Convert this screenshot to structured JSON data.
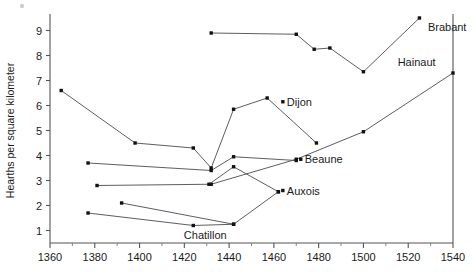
{
  "chart_data": {
    "type": "line",
    "title": "",
    "subtitle": "",
    "xlabel": "",
    "ylabel": "Hearths per square kilometer",
    "xlim": [
      1360,
      1540
    ],
    "ylim": [
      0.5,
      9.5
    ],
    "x_ticks": [
      1360,
      1380,
      1400,
      1420,
      1440,
      1460,
      1480,
      1500,
      1520,
      1540
    ],
    "x_tick_labels": [
      "1360",
      "1380",
      "1400",
      "1420",
      "1440",
      "1460",
      "1480",
      "1500",
      "1520",
      "1540"
    ],
    "x_minor_ticks": [
      1370,
      1390,
      1410,
      1430,
      1450,
      1470,
      1490,
      1510,
      1530
    ],
    "y_ticks": [
      1,
      2,
      3,
      4,
      5,
      6,
      7,
      8,
      9
    ],
    "y_tick_labels": [
      "1",
      "2",
      "3",
      "4",
      "5",
      "6",
      "7",
      "8",
      "9"
    ],
    "grid": false,
    "legend": "inline-end-labels",
    "marker": "square",
    "series": [
      {
        "name": "Brabant",
        "label": "Brabant",
        "label_x": 1527,
        "label_y": 9.15,
        "label_anchor": "start",
        "points": [
          {
            "x": 1432,
            "y": 8.9
          },
          {
            "x": 1470,
            "y": 8.85
          },
          {
            "x": 1478,
            "y": 8.25
          },
          {
            "x": 1485,
            "y": 8.3
          },
          {
            "x": 1500,
            "y": 7.35
          },
          {
            "x": 1525,
            "y": 9.5
          }
        ]
      },
      {
        "name": "Hainaut",
        "label": "Hainaut",
        "label_x": 1534,
        "label_y": 7.75,
        "label_anchor": "end",
        "points": [
          {
            "x": 1432,
            "y": 2.85
          },
          {
            "x": 1470,
            "y": 3.85
          },
          {
            "x": 1500,
            "y": 4.95
          },
          {
            "x": 1540,
            "y": 7.3
          }
        ]
      },
      {
        "name": "Dijon",
        "label": "Dijon",
        "label_x": 1464,
        "label_y": 6.15,
        "label_anchor": "start",
        "points": [
          {
            "x": 1365,
            "y": 6.6
          },
          {
            "x": 1398,
            "y": 4.5
          },
          {
            "x": 1424,
            "y": 4.3
          },
          {
            "x": 1432,
            "y": 3.5
          },
          {
            "x": 1442,
            "y": 5.85
          },
          {
            "x": 1457,
            "y": 6.3
          },
          {
            "x": 1479,
            "y": 4.5
          }
        ]
      },
      {
        "name": "Beaune",
        "label": "Beaune",
        "label_x": 1472,
        "label_y": 3.85,
        "label_anchor": "start",
        "points": [
          {
            "x": 1377,
            "y": 3.7
          },
          {
            "x": 1432,
            "y": 3.4
          },
          {
            "x": 1442,
            "y": 3.95
          },
          {
            "x": 1470,
            "y": 3.8
          }
        ]
      },
      {
        "name": "Auxois",
        "label": "Auxois",
        "label_x": 1464,
        "label_y": 2.6,
        "label_anchor": "start",
        "points": [
          {
            "x": 1381,
            "y": 2.8
          },
          {
            "x": 1431,
            "y": 2.85
          },
          {
            "x": 1442,
            "y": 3.55
          },
          {
            "x": 1462,
            "y": 2.55
          }
        ]
      },
      {
        "name": "Chatillon",
        "label": "Chatillon",
        "label_x": 1418,
        "label_y": 0.82,
        "label_anchor": "start",
        "points": [
          {
            "x": 1377,
            "y": 1.7
          },
          {
            "x": 1424,
            "y": 1.2
          },
          {
            "x": 1442,
            "y": 1.25
          },
          {
            "x": 1462,
            "y": 2.55
          }
        ]
      },
      {
        "name": "Auxois-upper",
        "label": "",
        "label_x": 0,
        "label_y": 0,
        "label_anchor": "start",
        "points": [
          {
            "x": 1392,
            "y": 2.1
          },
          {
            "x": 1442,
            "y": 1.25
          }
        ]
      }
    ],
    "colors": {
      "line": "#4b4b52",
      "marker": "#111111",
      "axis": "#555555",
      "text": "#1a1a1a",
      "background": "#ffffff"
    }
  }
}
